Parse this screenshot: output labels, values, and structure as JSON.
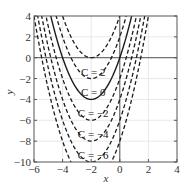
{
  "chart_data": {
    "type": "line",
    "title": "",
    "xlabel": "x",
    "ylabel": "y",
    "xlim": [
      -6,
      4
    ],
    "ylim": [
      -10,
      4
    ],
    "xticks": [
      -6,
      -4,
      -2,
      0,
      2,
      4
    ],
    "yticks": [
      4,
      2,
      0,
      -2,
      -4,
      -6,
      -8,
      -10
    ],
    "xtick_labels": [
      "−6",
      "−4",
      "−2",
      "0",
      "2",
      "4"
    ],
    "ytick_labels": [
      "4",
      "2",
      "0",
      "−2",
      "−4",
      "−6",
      "−8",
      "−10"
    ],
    "grid": true,
    "reference_lines": {
      "y": 0,
      "x": 0
    },
    "function": "y = x^2 + 4x + C",
    "series": [
      {
        "name": "C = 2",
        "C": 2,
        "style": "dashed",
        "label": "C = 2"
      },
      {
        "name": "C = 0",
        "C": 0,
        "style": "solid",
        "label": "C = 0"
      },
      {
        "name": "C = −2",
        "C": -2,
        "style": "dashed",
        "label": "C = −2"
      },
      {
        "name": "C = −4",
        "C": -4,
        "style": "dashed",
        "label": "C = −4"
      },
      {
        "name": "C = −6",
        "C": -6,
        "style": "dashed",
        "label": "C = −6"
      },
      {
        "name": "C = 4",
        "C": 4,
        "style": "dashed",
        "label": ""
      },
      {
        "name": "C = −8",
        "C": -8,
        "style": "dashed",
        "label": ""
      }
    ]
  },
  "colors": {
    "curve": "#1a1a1a",
    "axis": "#555555",
    "grid": "#e2e2e2",
    "text": "#333333"
  }
}
